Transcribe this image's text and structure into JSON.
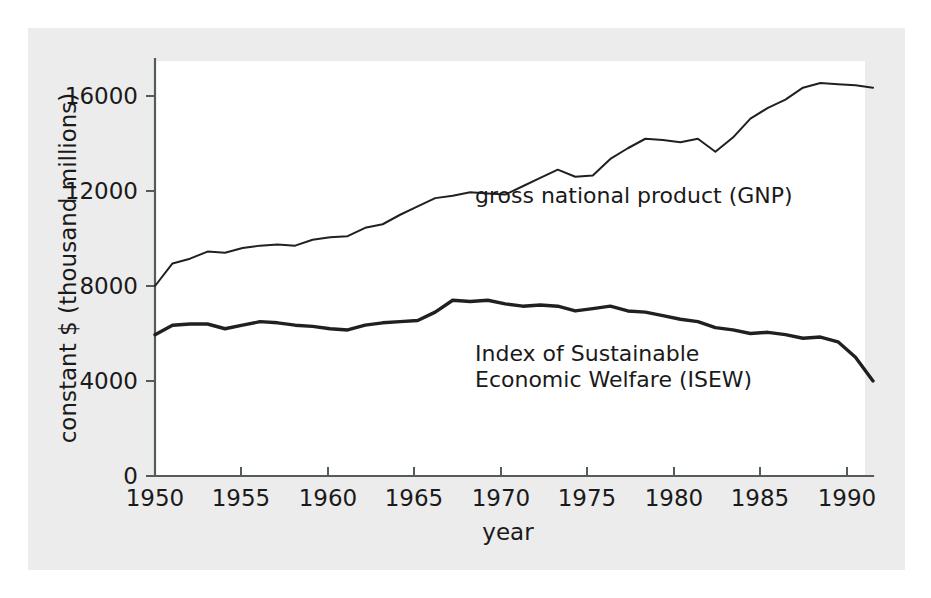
{
  "chart_data": {
    "type": "line",
    "title": "",
    "xlabel": "year",
    "ylabel": "constant $ (thousand millions)",
    "xlim": [
      1950,
      1991
    ],
    "ylim": [
      0,
      18000
    ],
    "grid": false,
    "legend_position": "inline-annotation",
    "x_ticks": [
      "1950",
      "1955",
      "1960",
      "1965",
      "1970",
      "1975",
      "1980",
      "1985",
      "1990"
    ],
    "x_tick_values": [
      1950,
      1955,
      1960,
      1965,
      1970,
      1975,
      1980,
      1985,
      1990
    ],
    "y_ticks": [
      "0",
      "4000",
      "8000",
      "12000",
      "16000"
    ],
    "y_tick_values": [
      0,
      4000,
      8000,
      12000,
      16000
    ],
    "x": [
      1950,
      1951,
      1952,
      1953,
      1954,
      1955,
      1956,
      1957,
      1958,
      1959,
      1960,
      1961,
      1962,
      1963,
      1964,
      1965,
      1966,
      1967,
      1968,
      1969,
      1970,
      1971,
      1972,
      1973,
      1974,
      1975,
      1976,
      1977,
      1978,
      1979,
      1980,
      1981,
      1982,
      1983,
      1984,
      1985,
      1986,
      1987,
      1988,
      1989,
      1990,
      1991
    ],
    "series": [
      {
        "name": "gross national product (GNP)",
        "label": "gross national product (GNP)",
        "color": "#231f20",
        "values": [
          8000,
          8950,
          9150,
          9450,
          9400,
          9600,
          9700,
          9750,
          9700,
          9950,
          10050,
          10100,
          10450,
          10600,
          11000,
          11350,
          11700,
          11800,
          11950,
          11900,
          11850,
          12200,
          12550,
          12900,
          12600,
          12650,
          13350,
          13800,
          14200,
          14150,
          14050,
          14200,
          13650,
          14250,
          15050,
          15500,
          15850,
          16350,
          16550,
          16500,
          16450,
          16350
        ]
      },
      {
        "name": "Index of Sustainable Economic Welfare (ISEW)",
        "label_line1": "Index of Sustainable",
        "label_line2": "Economic Welfare (ISEW)",
        "color": "#231f20",
        "values": [
          5950,
          6350,
          6400,
          6400,
          6200,
          6350,
          6500,
          6450,
          6350,
          6300,
          6200,
          6150,
          6350,
          6450,
          6500,
          6550,
          6900,
          7400,
          7350,
          7400,
          7250,
          7150,
          7200,
          7150,
          6950,
          7050,
          7150,
          6950,
          6900,
          6750,
          6600,
          6500,
          6250,
          6150,
          6000,
          6050,
          5950,
          5800,
          5850,
          5650,
          5000,
          4000
        ]
      }
    ],
    "annotations": [
      {
        "text": "gross national product (GNP)",
        "series": "gross national product (GNP)"
      },
      {
        "text": "Index of Sustainable Economic Welfare (ISEW)",
        "series": "Index of Sustainable Economic Welfare (ISEW)"
      }
    ]
  },
  "figure": {
    "background_color": "#ececec",
    "plot_background_color": "#ffffff",
    "axis_color": "#555a5c",
    "line_color": "#231f20"
  },
  "labels": {
    "y_axis_title": "constant $ (thousand millions)",
    "x_axis_title": "year",
    "gnp_annotation": "gross national product (GNP)",
    "isew_annotation_line1": "Index of Sustainable",
    "isew_annotation_line2": "Economic Welfare (ISEW)",
    "ytick_0": "0",
    "ytick_4000": "4000",
    "ytick_8000": "8000",
    "ytick_12000": "12000",
    "ytick_16000": "16000",
    "xtick_1950": "1950",
    "xtick_1955": "1955",
    "xtick_1960": "1960",
    "xtick_1965": "1965",
    "xtick_1970": "1970",
    "xtick_1975": "1975",
    "xtick_1980": "1980",
    "xtick_1985": "1985",
    "xtick_1990": "1990"
  }
}
